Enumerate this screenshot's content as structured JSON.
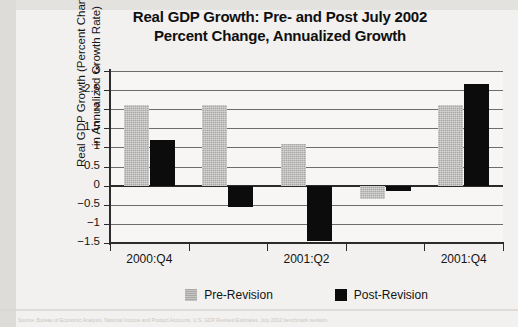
{
  "chart_data": {
    "type": "bar",
    "title": "Real GDP Growth: Pre- and Post July 2002 Percent Change, Annualized Growth",
    "title_line1": "Real GDP Growth: Pre- and Post July 2002",
    "title_line2": "Percent Change, Annualized Growth",
    "xlabel": "",
    "ylabel": "Real GDP Growth (Percent Change in Annualized Growth Rate)",
    "ylabel_line1": "Real GDP Growth (Percent Change",
    "ylabel_line2": "in Annualized Growth Rate)",
    "categories": [
      "2000:Q4",
      "",
      "2001:Q2",
      "",
      "2001:Q4"
    ],
    "tick_labels": [
      "2000:Q4",
      "2001:Q2",
      "2001:Q4"
    ],
    "series": [
      {
        "name": "Pre-Revision",
        "color": "#a9a8a6",
        "values": [
          2.1,
          2.1,
          1.1,
          -0.35,
          2.1
        ]
      },
      {
        "name": "Post-Revision",
        "color": "#0c0c0c",
        "values": [
          1.2,
          -0.55,
          -1.45,
          -0.15,
          2.65
        ]
      }
    ],
    "ylim": [
      -1.5,
      3
    ],
    "ytick_values": [
      3,
      2.5,
      2,
      1.5,
      1,
      0.5,
      0,
      -0.5,
      -1,
      -1.5
    ],
    "ytick_labels": [
      "3",
      "2.5",
      "2",
      "1.5",
      "1",
      "0.5",
      "0",
      "−0.5",
      "−1",
      "−1.5"
    ],
    "grid": true,
    "legend_position": "bottom"
  },
  "legend": {
    "items": [
      {
        "label": "Pre-Revision",
        "swatch": "pre"
      },
      {
        "label": "Post-Revision",
        "swatch": "post"
      }
    ]
  },
  "footer": {
    "source_text": "Source: Bureau of Economic Analysis, National Income and Product Accounts, U.S. GDP Revised Estimates, July 2002 benchmark revision."
  }
}
